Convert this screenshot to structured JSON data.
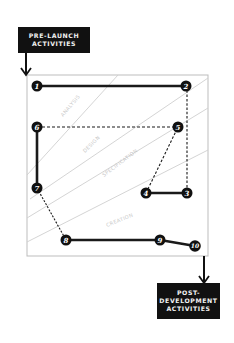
{
  "diagram": {
    "start_box": {
      "line1": "PRE-LAUNCH",
      "line2": "ACTIVITIES"
    },
    "end_box": {
      "line1": "POST-",
      "line2": "DEVELOPMENT",
      "line3": "ACTIVITIES"
    },
    "bands": [
      {
        "label": "ANALYSIS"
      },
      {
        "label": "DESIGN"
      },
      {
        "label": "SPECIFICATION"
      },
      {
        "label": "CREATION"
      }
    ],
    "nodes": [
      {
        "id": "1",
        "label": "1"
      },
      {
        "id": "2",
        "label": "2"
      },
      {
        "id": "3",
        "label": "3"
      },
      {
        "id": "4",
        "label": "4"
      },
      {
        "id": "5",
        "label": "5"
      },
      {
        "id": "6",
        "label": "6"
      },
      {
        "id": "7",
        "label": "7"
      },
      {
        "id": "8",
        "label": "8"
      },
      {
        "id": "9",
        "label": "9"
      },
      {
        "id": "10",
        "label": "10"
      }
    ],
    "edges": [
      {
        "from": "1",
        "to": "2",
        "style": "solid"
      },
      {
        "from": "2",
        "to": "3",
        "style": "dashed"
      },
      {
        "from": "3",
        "to": "4",
        "style": "solid"
      },
      {
        "from": "4",
        "to": "5",
        "style": "dashed"
      },
      {
        "from": "5",
        "to": "6",
        "style": "dashed"
      },
      {
        "from": "6",
        "to": "7",
        "style": "solid"
      },
      {
        "from": "7",
        "to": "8",
        "style": "dashed"
      },
      {
        "from": "8",
        "to": "9",
        "style": "solid"
      },
      {
        "from": "9",
        "to": "10",
        "style": "solid"
      }
    ],
    "colors": {
      "node_fill": "#111111",
      "line": "#1a1a1a",
      "frame": "#bdbdbd",
      "band_line": "#cfcfcf",
      "band_text": "#c8c8c8"
    }
  }
}
